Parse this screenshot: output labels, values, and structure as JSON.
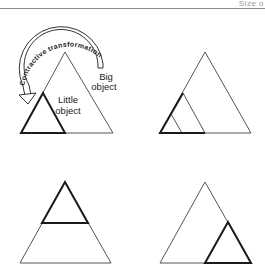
{
  "header": {
    "running_title": "Size o"
  },
  "diagram": {
    "arrow_label": "Contractive transformation",
    "big_label_line1": "Big",
    "big_label_line2": "object",
    "little_label_line1": "Little",
    "little_label_line2": "object",
    "panels": [
      {
        "id": "top-left",
        "description": "Big triangle with little contracted triangle at left corner, curved arrow"
      },
      {
        "id": "top-right",
        "description": "Nested contractions toward left corner"
      },
      {
        "id": "bottom-left",
        "description": "Contracted triangle at top vertex"
      },
      {
        "id": "bottom-right",
        "description": "Contracted triangle at right corner"
      }
    ],
    "colors": {
      "line": "#555555",
      "bold_line": "#1a1a1a"
    }
  }
}
